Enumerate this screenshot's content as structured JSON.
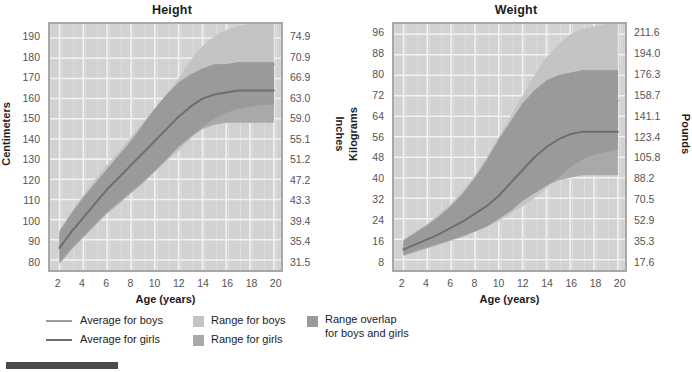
{
  "colors": {
    "plot_background": "#d2d2d2",
    "plot_border": "#a8a8a8",
    "gridline": "#f2f2f2",
    "range_boys": "#c4c4c4",
    "range_girls": "#a9a9a9",
    "range_overlap": "#9a9a9a",
    "line_boys": "#9b9b9b",
    "line_girls": "#6e6e6e",
    "tick_text": "#545454",
    "title_text": "#1c1c1c",
    "bottom_bar": "#4a4a4a"
  },
  "panels": [
    {
      "id": "height",
      "title": "Height",
      "left_axis_label": "Centimeters",
      "right_axis_label": "Inches",
      "x_axis_label": "Age (years)",
      "left_ticks": [
        "190",
        "180",
        "170",
        "160",
        "150",
        "140",
        "130",
        "120",
        "110",
        "100",
        "90",
        "80"
      ],
      "right_ticks": [
        "74.9",
        "70.9",
        "66.9",
        "63.0",
        "59.0",
        "55.1",
        "51.2",
        "47.2",
        "43.3",
        "39.4",
        "35.4",
        "31.5"
      ],
      "x_ticks": [
        "2",
        "4",
        "6",
        "8",
        "10",
        "12",
        "14",
        "16",
        "18",
        "20"
      ]
    },
    {
      "id": "weight",
      "title": "Weight",
      "left_axis_label": "Kilograms",
      "right_axis_label": "Pounds",
      "x_axis_label": "Age (years)",
      "left_ticks": [
        "96",
        "88",
        "80",
        "72",
        "64",
        "56",
        "48",
        "40",
        "32",
        "24",
        "16",
        "8"
      ],
      "right_ticks": [
        "211.6",
        "194.0",
        "176.3",
        "158.7",
        "141.1",
        "123.4",
        "105.8",
        "88.2",
        "70.5",
        "52.9",
        "35.3",
        "17.6"
      ],
      "x_ticks": [
        "2",
        "4",
        "6",
        "8",
        "10",
        "12",
        "14",
        "16",
        "18",
        "20"
      ]
    }
  ],
  "legend": {
    "columns": [
      {
        "items": [
          {
            "type": "line",
            "label": "Average for boys",
            "color": "#9b9b9b"
          },
          {
            "type": "line",
            "label": "Average for girls",
            "color": "#6e6e6e"
          }
        ]
      },
      {
        "items": [
          {
            "type": "box",
            "label": "Range for boys",
            "color": "#c4c4c4"
          },
          {
            "type": "box",
            "label": "Range for girls",
            "color": "#a9a9a9"
          }
        ]
      },
      {
        "items": [
          {
            "type": "box",
            "label": "Range overlap\nfor boys and girls",
            "color": "#9a9a9a"
          }
        ]
      }
    ]
  },
  "chart_data": [
    {
      "type": "area",
      "id": "height",
      "title": "Height",
      "xlabel": "Age (years)",
      "ylabel": "Centimeters",
      "ylabel_secondary": "Inches",
      "xlim": [
        1.2,
        20.6
      ],
      "ylim": [
        75,
        197
      ],
      "ylim_secondary": [
        29.5,
        77.6
      ],
      "grid": true,
      "legend_position": "below-figure",
      "x": [
        2,
        3,
        4,
        5,
        6,
        7,
        8,
        9,
        10,
        11,
        12,
        13,
        14,
        15,
        16,
        17,
        18,
        19,
        20
      ],
      "series": [
        {
          "name": "Average for boys",
          "kind": "line",
          "color": "#9b9b9b",
          "values": [
            87,
            95,
            102,
            109,
            115,
            122,
            128,
            133,
            139,
            144,
            150,
            157,
            165,
            171,
            174,
            176,
            177,
            177,
            177
          ]
        },
        {
          "name": "Average for girls",
          "kind": "line",
          "color": "#6e6e6e",
          "values": [
            86,
            94,
            101,
            108,
            115,
            121,
            127,
            133,
            139,
            145,
            151,
            156,
            160,
            162,
            163,
            164,
            164,
            164,
            164
          ]
        },
        {
          "name": "Range for boys",
          "kind": "band",
          "color": "#c4c4c4",
          "lower": [
            79,
            86,
            92,
            98,
            104,
            109,
            114,
            119,
            124,
            129,
            134,
            140,
            146,
            150,
            153,
            155,
            156,
            157,
            157
          ],
          "upper": [
            95,
            104,
            112,
            120,
            127,
            134,
            141,
            148,
            155,
            162,
            170,
            179,
            186,
            191,
            194,
            196,
            197,
            197,
            197
          ]
        },
        {
          "name": "Range for girls",
          "kind": "band",
          "color": "#a9a9a9",
          "lower": [
            78,
            85,
            91,
            97,
            103,
            108,
            113,
            118,
            124,
            130,
            136,
            141,
            145,
            147,
            148,
            148,
            148,
            148,
            148
          ],
          "upper": [
            94,
            103,
            111,
            118,
            125,
            132,
            139,
            147,
            155,
            162,
            168,
            172,
            175,
            177,
            177,
            178,
            178,
            178,
            178
          ]
        }
      ]
    },
    {
      "type": "area",
      "id": "weight",
      "title": "Weight",
      "xlabel": "Age (years)",
      "ylabel": "Kilograms",
      "ylabel_secondary": "Pounds",
      "xlim": [
        1.2,
        20.6
      ],
      "ylim": [
        4,
        100
      ],
      "ylim_secondary": [
        8.8,
        220.5
      ],
      "grid": true,
      "legend_position": "below-figure",
      "x": [
        2,
        3,
        4,
        5,
        6,
        7,
        8,
        9,
        10,
        11,
        12,
        13,
        14,
        15,
        16,
        17,
        18,
        19,
        20
      ],
      "series": [
        {
          "name": "Average for boys",
          "kind": "line",
          "color": "#9b9b9b",
          "values": [
            12.5,
            14.5,
            16.5,
            18.5,
            21,
            23,
            26,
            29,
            32,
            36,
            41,
            46,
            52,
            58,
            63,
            66,
            68,
            69,
            70
          ]
        },
        {
          "name": "Average for girls",
          "kind": "line",
          "color": "#6e6e6e",
          "values": [
            12,
            14,
            16,
            18,
            20.5,
            23,
            26,
            29,
            33,
            38,
            43,
            48,
            52,
            55,
            57,
            58,
            58,
            58,
            58
          ]
        },
        {
          "name": "Range for boys",
          "kind": "band",
          "color": "#c4c4c4",
          "lower": [
            10,
            11.5,
            13,
            14.5,
            16,
            17.5,
            19,
            21,
            23,
            26,
            29,
            32,
            36,
            40,
            44,
            47,
            49,
            50,
            51
          ],
          "upper": [
            16,
            19,
            22,
            26,
            30,
            35,
            41,
            48,
            56,
            64,
            72,
            80,
            87,
            92,
            96,
            98,
            99,
            100,
            100
          ]
        },
        {
          "name": "Range for girls",
          "kind": "band",
          "color": "#a9a9a9",
          "lower": [
            9.5,
            11,
            12.5,
            14,
            15.5,
            17,
            19,
            21,
            24,
            27,
            31,
            34,
            37,
            39,
            40,
            41,
            41,
            41,
            41
          ],
          "upper": [
            15.5,
            18.5,
            21.5,
            25,
            29,
            34,
            40,
            47,
            55,
            62,
            69,
            74,
            78,
            80,
            81,
            82,
            82,
            82,
            82
          ]
        }
      ]
    }
  ]
}
